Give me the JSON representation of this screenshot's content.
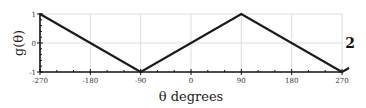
{
  "chart_data": {
    "type": "line",
    "title": "",
    "xlabel": "θ degrees",
    "ylabel": "g(θ)",
    "panel_label": "2",
    "x": [
      -270,
      -90,
      90,
      270
    ],
    "series": [
      {
        "name": "g(θ)",
        "values": [
          1,
          -1,
          1,
          -1
        ],
        "color": "#1a1a1a"
      }
    ],
    "xlim": [
      -270,
      270
    ],
    "ylim": [
      -1,
      1
    ],
    "xticks": [
      -270,
      -180,
      -90,
      0,
      90,
      180,
      270
    ],
    "xtick_labels": [
      "-270",
      "-180",
      "-90",
      "0",
      "90",
      "180",
      "270"
    ],
    "yticks": [
      -1,
      0,
      1
    ],
    "ytick_labels": [
      "-1",
      "0",
      "1"
    ],
    "grid": true,
    "legend": null
  },
  "colors": {
    "line": "#1a1a1a",
    "axis": "#111111",
    "grid": "#dddddd"
  }
}
